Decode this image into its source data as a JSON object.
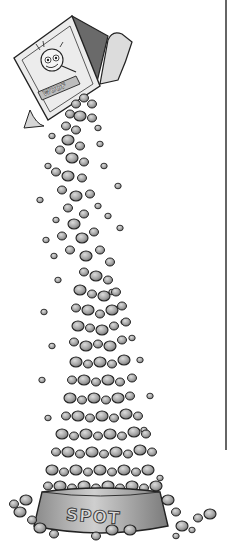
{
  "illustration": {
    "subject": "box of pet food pouring kibble into a dog bowl",
    "bowl_label": "SPOT",
    "box_label": "WOOF",
    "style": "grayscale pen and ink with gray shading",
    "colors": {
      "background": "#ffffff",
      "ink": "#222222",
      "kibble_fill": "#9a9a9a",
      "kibble_highlight": "#d0d0d0",
      "bowl_fill": "#b8b8b8",
      "box_fill": "#e6e6e6",
      "border_line": "#333333"
    },
    "border_line": {
      "x": 226,
      "y_start": 0,
      "y_end": 450
    }
  }
}
